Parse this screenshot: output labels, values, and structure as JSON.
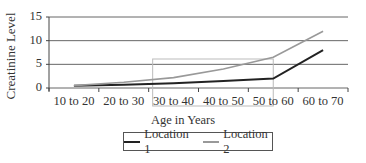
{
  "chart_data": {
    "type": "line",
    "title": "",
    "xlabel": "Age in Years",
    "ylabel": "Creatinine Level",
    "categories": [
      "10 to 20",
      "20 to 30",
      "30 to 40",
      "40 to 50",
      "50 to 60",
      "60 to 70"
    ],
    "series": [
      {
        "name": "Location 1",
        "color": "#222222",
        "values": [
          0.5,
          0.7,
          1.0,
          1.5,
          2.0,
          8.0
        ]
      },
      {
        "name": "Location 2",
        "color": "#999999",
        "values": [
          0.5,
          1.2,
          2.2,
          4.0,
          6.5,
          12.0
        ]
      }
    ],
    "ylim": [
      0,
      15
    ],
    "yticks": [
      0,
      5,
      10,
      15
    ],
    "grid": true,
    "legend_position": "bottom"
  },
  "annotation": {
    "type": "highlight-box",
    "from_category": "30 to 40",
    "to_category": "50 to 60"
  }
}
